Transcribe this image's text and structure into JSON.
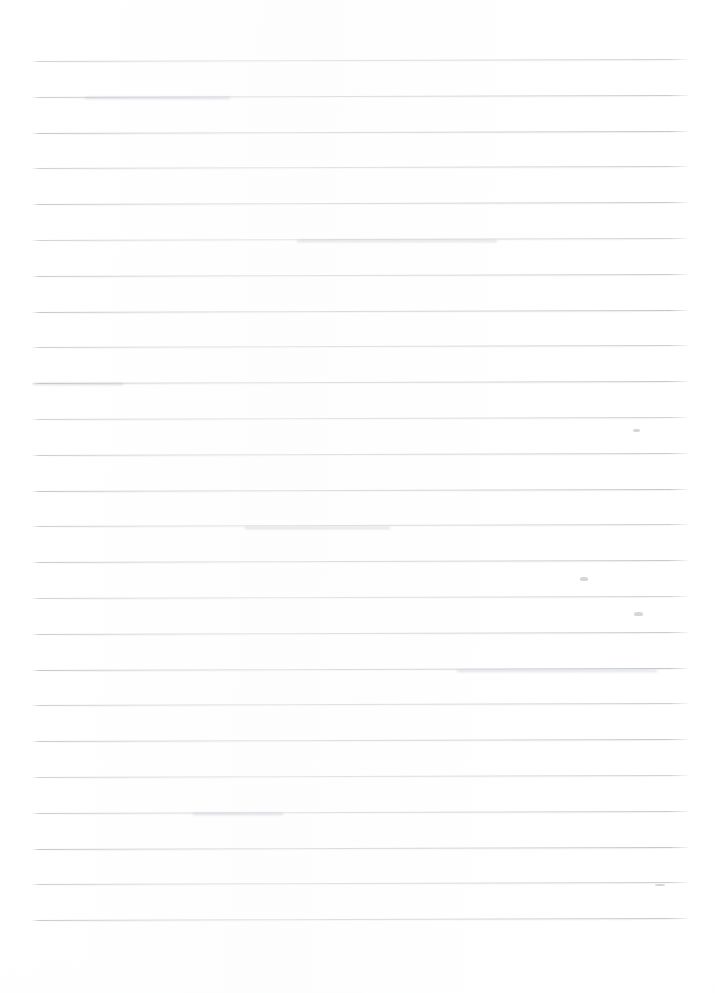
{
  "document": {
    "type": "scanned-ruled-paper",
    "title": "Blank lined notebook page",
    "content_text": "",
    "handwriting_present": "none",
    "page_width_px": 715,
    "page_height_px": 993,
    "background_color": "#ffffff"
  },
  "ruling": {
    "line_color": "#c3c7cc",
    "line_shadow_color": "#e6e8eb",
    "line_count": 25,
    "first_line_y": 61,
    "line_spacing_px": 35.8,
    "line_left_x": 32,
    "line_right_x": 688,
    "line_thickness_px": 1,
    "skew_degrees": -0.18,
    "margin_rule_present": "none",
    "header_rule_present": "none",
    "line_y_positions": [
      61,
      96.8,
      132.6,
      168.4,
      204.2,
      240,
      275.8,
      311.6,
      347.4,
      383.2,
      419,
      454.8,
      490.6,
      526.4,
      562.2,
      598,
      633.8,
      669.6,
      705.4,
      741.2,
      777,
      812.8,
      848.6,
      884.4,
      920.2
    ]
  },
  "margins": {
    "top_margin_px": 61,
    "bottom_margin_px": 50,
    "left_margin_px": 32,
    "right_margin_px": 27
  },
  "artifacts": {
    "label": "faint scan smudges on rules",
    "marks": [
      {
        "name": "smudge-upper-right",
        "x": 633,
        "y": 429,
        "w": 7,
        "h": 3
      },
      {
        "name": "smudge-mid-right",
        "x": 580,
        "y": 577,
        "w": 8,
        "h": 4
      },
      {
        "name": "smudge-lower-right",
        "x": 634,
        "y": 612,
        "w": 9,
        "h": 4
      },
      {
        "name": "smudge-lower-edge",
        "x": 655,
        "y": 884,
        "w": 10,
        "h": 2
      }
    ]
  }
}
